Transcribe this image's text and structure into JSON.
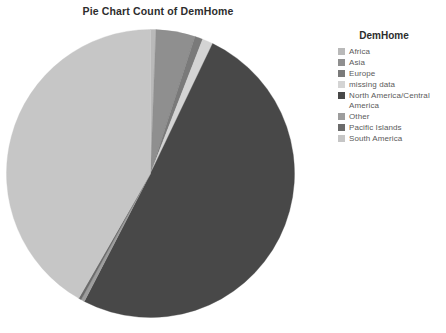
{
  "chart": {
    "title": "Pie Chart Count of DemHome"
  },
  "legend": {
    "title": "DemHome",
    "items": [
      {
        "label": "Africa",
        "color": "#b9b9b9"
      },
      {
        "label": "Asia",
        "color": "#8f8f8f"
      },
      {
        "label": "Europe",
        "color": "#7a7a7a"
      },
      {
        "label": "missing data",
        "color": "#d4d4d4"
      },
      {
        "label": "North America/Central America",
        "color": "#484848"
      },
      {
        "label": "Other",
        "color": "#9d9d9d"
      },
      {
        "label": "Pacific Islands",
        "color": "#6b6b6b"
      },
      {
        "label": "South America",
        "color": "#c6c6c6"
      }
    ]
  },
  "chart_data": {
    "type": "pie",
    "title": "Pie Chart Count of DemHome",
    "legend_title": "DemHome",
    "legend_position": "right",
    "start_angle_deg": 0,
    "direction": "clockwise",
    "labels": [
      "Africa",
      "Asia",
      "Europe",
      "missing data",
      "North America/Central America",
      "Other",
      "Pacific Islands",
      "South America"
    ],
    "colors": [
      "#b9b9b9",
      "#8f8f8f",
      "#7a7a7a",
      "#d4d4d4",
      "#484848",
      "#9d9d9d",
      "#6b6b6b",
      "#c6c6c6"
    ],
    "values": [
      0.6,
      4.4,
      0.9,
      1.2,
      50.5,
      0.4,
      0.3,
      41.7
    ],
    "value_unit": "percent",
    "slices": [
      {
        "label": "Africa",
        "percent": 0.6,
        "color": "#b9b9b9"
      },
      {
        "label": "Asia",
        "percent": 4.4,
        "color": "#8f8f8f"
      },
      {
        "label": "Europe",
        "percent": 0.9,
        "color": "#7a7a7a"
      },
      {
        "label": "missing data",
        "percent": 1.2,
        "color": "#d4d4d4"
      },
      {
        "label": "North America/Central America",
        "percent": 50.5,
        "color": "#484848"
      },
      {
        "label": "Other",
        "percent": 0.4,
        "color": "#9d9d9d"
      },
      {
        "label": "Pacific Islands",
        "percent": 0.3,
        "color": "#6b6b6b"
      },
      {
        "label": "South America",
        "percent": 41.7,
        "color": "#c6c6c6"
      }
    ],
    "grid": false,
    "data_labels_shown": false
  },
  "geometry": {
    "cx": 144.5,
    "cy": 144.5,
    "r": 144
  }
}
